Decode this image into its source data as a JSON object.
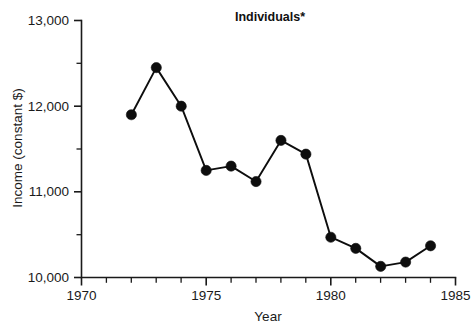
{
  "chart_data": {
    "type": "line",
    "title": "Individuals*",
    "xlabel": "Year",
    "ylabel": "Income (constant $)",
    "xlim": [
      1970,
      1985
    ],
    "ylim": [
      10000,
      13000
    ],
    "grid": false,
    "legend": null,
    "x_major_ticks": [
      1970,
      1975,
      1980,
      1985
    ],
    "x_major_tick_labels": [
      "1970",
      "1975",
      "1980",
      "1985"
    ],
    "x_minor_tick_step": 1,
    "y_major_ticks": [
      10000,
      11000,
      12000,
      13000
    ],
    "y_major_tick_labels": [
      "10,000",
      "11,000",
      "12,000",
      "13,000"
    ],
    "y_minor_ticks": [
      10500,
      11500,
      12500
    ],
    "marker": "filled-circle",
    "line_color": "#0d0d0d",
    "marker_color": "#0d0d0d",
    "background_color": "#ffffff",
    "x": [
      1972,
      1973,
      1974,
      1975,
      1976,
      1977,
      1978,
      1979,
      1980,
      1981,
      1982,
      1983,
      1984
    ],
    "values": [
      11900,
      12450,
      12000,
      11250,
      11300,
      11120,
      11600,
      11440,
      10470,
      10340,
      10130,
      10180,
      10370
    ],
    "series": [
      {
        "name": "Individuals",
        "x": [
          1972,
          1973,
          1974,
          1975,
          1976,
          1977,
          1978,
          1979,
          1980,
          1981,
          1982,
          1983,
          1984
        ],
        "values": [
          11900,
          12450,
          12000,
          11250,
          11300,
          11120,
          11600,
          11440,
          10470,
          10340,
          10130,
          10180,
          10370
        ]
      }
    ]
  },
  "figure": {
    "title": "Individuals*",
    "footnote_marker": "*"
  }
}
